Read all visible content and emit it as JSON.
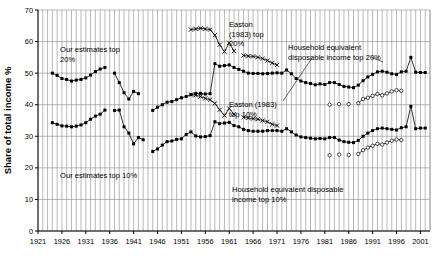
{
  "chart": {
    "type": "line",
    "ylabel": "Share of total income %",
    "ytick_labels": [
      "0",
      "10",
      "20",
      "30",
      "40",
      "50",
      "60",
      "70"
    ],
    "xtick_labels": [
      "1921",
      "1926",
      "1931",
      "1936",
      "1941",
      "1946",
      "1951",
      "1956",
      "1961",
      "1966",
      "1971",
      "1976",
      "1981",
      "1986",
      "1991",
      "1996",
      "2001"
    ]
  },
  "annotations": [
    {
      "id": "our20",
      "line1": "Our estimates top",
      "line2": "20%"
    },
    {
      "id": "our10",
      "line1": "Our estimates top 10%",
      "line2": ""
    },
    {
      "id": "easton20",
      "line1": "Easton",
      "line2": "(1983) top",
      "line3": "20%"
    },
    {
      "id": "easton10",
      "line1": "Easton (1983)",
      "line2": "top 10%"
    },
    {
      "id": "hh20",
      "line1": "Household equivalent",
      "line2": "disposable income top 20%"
    },
    {
      "id": "hh10",
      "line1": "Household equivalent disposable",
      "line2": "income top 10%"
    }
  ],
  "chart_data": {
    "type": "line",
    "title": "",
    "xlabel": "",
    "ylabel": "Share of total income %",
    "ylim": [
      0,
      70
    ],
    "xlim": [
      1921,
      2003
    ],
    "ytick_interval": 10,
    "xtick_interval": 5,
    "grid": true,
    "legend": "annotations-inline",
    "categories": [
      "1921",
      "1926",
      "1931",
      "1936",
      "1941",
      "1946",
      "1951",
      "1956",
      "1961",
      "1966",
      "1971",
      "1976",
      "1981",
      "1986",
      "1991",
      "1996",
      "2001"
    ],
    "series": [
      {
        "name": "Our estimates top 20%",
        "marker": "filled-square",
        "points": [
          [
            1924,
            50.0
          ],
          [
            1925,
            49.3
          ],
          [
            1926,
            48.3
          ],
          [
            1927,
            48.0
          ],
          [
            1928,
            47.5
          ],
          [
            1929,
            47.8
          ],
          [
            1930,
            48.0
          ],
          [
            1931,
            48.5
          ],
          [
            1932,
            49.4
          ],
          [
            1933,
            50.5
          ],
          [
            1934,
            51.3
          ],
          [
            1935,
            51.8
          ],
          [
            1937,
            50.0
          ],
          [
            1938,
            47.0
          ],
          [
            1939,
            43.8
          ],
          [
            1940,
            41.8
          ],
          [
            1941,
            44.2
          ],
          [
            1942,
            43.5
          ],
          [
            1945,
            38.2
          ],
          [
            1946,
            39.2
          ],
          [
            1947,
            40.0
          ],
          [
            1948,
            40.8
          ],
          [
            1949,
            41.0
          ],
          [
            1950,
            41.6
          ],
          [
            1951,
            42.2
          ],
          [
            1952,
            42.6
          ],
          [
            1953,
            43.2
          ],
          [
            1954,
            43.6
          ],
          [
            1955,
            43.6
          ],
          [
            1956,
            43.4
          ],
          [
            1957,
            43.5
          ],
          [
            1958,
            53.0
          ],
          [
            1959,
            52.2
          ],
          [
            1960,
            52.4
          ],
          [
            1961,
            52.6
          ],
          [
            1962,
            51.8
          ],
          [
            1963,
            51.2
          ],
          [
            1964,
            50.6
          ],
          [
            1965,
            50.0
          ],
          [
            1966,
            49.9
          ],
          [
            1967,
            49.9
          ],
          [
            1968,
            49.8
          ],
          [
            1969,
            49.9
          ],
          [
            1970,
            50.0
          ],
          [
            1971,
            50.1
          ],
          [
            1972,
            50.0
          ],
          [
            1973,
            51.0
          ],
          [
            1974,
            49.8
          ],
          [
            1975,
            48.3
          ],
          [
            1976,
            47.5
          ],
          [
            1977,
            47.0
          ],
          [
            1978,
            46.7
          ],
          [
            1979,
            46.3
          ],
          [
            1980,
            46.6
          ],
          [
            1981,
            46.4
          ],
          [
            1982,
            47.0
          ],
          [
            1983,
            47.0
          ],
          [
            1984,
            46.4
          ],
          [
            1985,
            45.8
          ],
          [
            1986,
            45.6
          ],
          [
            1987,
            45.4
          ],
          [
            1988,
            46.2
          ],
          [
            1989,
            47.6
          ],
          [
            1990,
            48.8
          ],
          [
            1991,
            49.6
          ],
          [
            1992,
            50.4
          ],
          [
            1993,
            50.6
          ],
          [
            1994,
            50.3
          ],
          [
            1995,
            49.8
          ],
          [
            1996,
            49.6
          ],
          [
            1997,
            50.4
          ],
          [
            1998,
            50.6
          ],
          [
            1999,
            55.0
          ],
          [
            2000,
            50.3
          ],
          [
            2001,
            50.2
          ],
          [
            2002,
            50.2
          ]
        ]
      },
      {
        "name": "Our estimates top 10%",
        "marker": "filled-square",
        "points": [
          [
            1924,
            34.3
          ],
          [
            1925,
            33.8
          ],
          [
            1926,
            33.3
          ],
          [
            1927,
            33.2
          ],
          [
            1928,
            33.0
          ],
          [
            1929,
            33.2
          ],
          [
            1930,
            33.6
          ],
          [
            1931,
            34.3
          ],
          [
            1932,
            35.4
          ],
          [
            1933,
            36.4
          ],
          [
            1934,
            37.0
          ],
          [
            1935,
            38.3
          ],
          [
            1937,
            38.2
          ],
          [
            1938,
            38.3
          ],
          [
            1939,
            33.0
          ],
          [
            1940,
            31.0
          ],
          [
            1941,
            27.6
          ],
          [
            1942,
            29.6
          ],
          [
            1943,
            28.9
          ],
          [
            1945,
            25.2
          ],
          [
            1946,
            26.0
          ],
          [
            1947,
            27.2
          ],
          [
            1948,
            28.3
          ],
          [
            1949,
            28.5
          ],
          [
            1950,
            29.0
          ],
          [
            1951,
            29.2
          ],
          [
            1952,
            30.6
          ],
          [
            1953,
            31.4
          ],
          [
            1954,
            30.1
          ],
          [
            1955,
            29.8
          ],
          [
            1956,
            29.9
          ],
          [
            1957,
            30.2
          ],
          [
            1958,
            34.6
          ],
          [
            1959,
            34.0
          ],
          [
            1960,
            34.2
          ],
          [
            1961,
            34.4
          ],
          [
            1962,
            33.4
          ],
          [
            1963,
            33.0
          ],
          [
            1964,
            32.2
          ],
          [
            1965,
            31.8
          ],
          [
            1966,
            31.6
          ],
          [
            1967,
            31.6
          ],
          [
            1968,
            31.6
          ],
          [
            1969,
            31.8
          ],
          [
            1970,
            31.8
          ],
          [
            1971,
            31.8
          ],
          [
            1972,
            31.6
          ],
          [
            1973,
            32.4
          ],
          [
            1974,
            31.4
          ],
          [
            1975,
            30.4
          ],
          [
            1976,
            29.8
          ],
          [
            1977,
            29.6
          ],
          [
            1978,
            29.4
          ],
          [
            1979,
            29.2
          ],
          [
            1980,
            29.3
          ],
          [
            1981,
            29.2
          ],
          [
            1982,
            29.6
          ],
          [
            1983,
            29.6
          ],
          [
            1984,
            28.8
          ],
          [
            1985,
            28.3
          ],
          [
            1986,
            28.1
          ],
          [
            1987,
            28.0
          ],
          [
            1988,
            28.7
          ],
          [
            1989,
            30.0
          ],
          [
            1990,
            31.0
          ],
          [
            1991,
            31.8
          ],
          [
            1992,
            32.4
          ],
          [
            1993,
            32.6
          ],
          [
            1994,
            32.4
          ],
          [
            1995,
            32.2
          ],
          [
            1996,
            32.0
          ],
          [
            1997,
            32.7
          ],
          [
            1998,
            33.0
          ],
          [
            1999,
            39.5
          ],
          [
            2000,
            32.4
          ],
          [
            2001,
            32.6
          ],
          [
            2002,
            32.6
          ]
        ]
      },
      {
        "name": "Easton (1983) top 20%",
        "marker": "cross",
        "points": [
          [
            1953,
            63.8
          ],
          [
            1954,
            64.0
          ],
          [
            1955,
            64.2
          ],
          [
            1956,
            64.0
          ],
          [
            1957,
            63.8
          ],
          [
            1958,
            62.0
          ],
          [
            1959,
            59.0
          ],
          [
            1960,
            56.8
          ],
          [
            1961,
            59.6
          ],
          [
            1962,
            57.0
          ],
          [
            1964,
            55.6
          ],
          [
            1965,
            55.4
          ],
          [
            1966,
            55.3
          ],
          [
            1967,
            55.0
          ],
          [
            1968,
            54.6
          ],
          [
            1969,
            54.0
          ],
          [
            1970,
            53.2
          ],
          [
            1971,
            52.6
          ]
        ]
      },
      {
        "name": "Easton (1983) top 10%",
        "marker": "cross",
        "points": [
          [
            1953,
            43.2
          ],
          [
            1954,
            43.0
          ],
          [
            1955,
            42.6
          ],
          [
            1956,
            42.0
          ],
          [
            1957,
            41.6
          ],
          [
            1958,
            40.4
          ],
          [
            1959,
            38.4
          ],
          [
            1960,
            36.6
          ],
          [
            1961,
            38.8
          ],
          [
            1962,
            37.0
          ],
          [
            1964,
            36.0
          ],
          [
            1965,
            35.8
          ],
          [
            1966,
            35.6
          ],
          [
            1967,
            35.4
          ],
          [
            1968,
            35.0
          ],
          [
            1969,
            34.6
          ],
          [
            1970,
            33.8
          ],
          [
            1971,
            33.4
          ]
        ]
      },
      {
        "name": "Household equivalent disposable income top 20%",
        "marker": "open-circle",
        "points": [
          [
            1982,
            40.0
          ],
          [
            1984,
            40.2
          ],
          [
            1986,
            40.2
          ],
          [
            1988,
            40.5
          ],
          [
            1989,
            41.8
          ],
          [
            1990,
            42.2
          ],
          [
            1991,
            42.8
          ],
          [
            1992,
            43.4
          ],
          [
            1993,
            43.0
          ],
          [
            1994,
            43.6
          ],
          [
            1995,
            44.2
          ],
          [
            1996,
            44.6
          ],
          [
            1997,
            44.4
          ]
        ]
      },
      {
        "name": "Household equivalent disposable income top 10%",
        "marker": "open-circle",
        "points": [
          [
            1982,
            24.0
          ],
          [
            1984,
            24.2
          ],
          [
            1986,
            24.1
          ],
          [
            1988,
            24.4
          ],
          [
            1989,
            25.6
          ],
          [
            1990,
            26.4
          ],
          [
            1991,
            27.0
          ],
          [
            1992,
            27.6
          ],
          [
            1993,
            27.4
          ],
          [
            1994,
            28.0
          ],
          [
            1995,
            28.6
          ],
          [
            1996,
            29.0
          ],
          [
            1997,
            28.8
          ]
        ]
      }
    ]
  }
}
